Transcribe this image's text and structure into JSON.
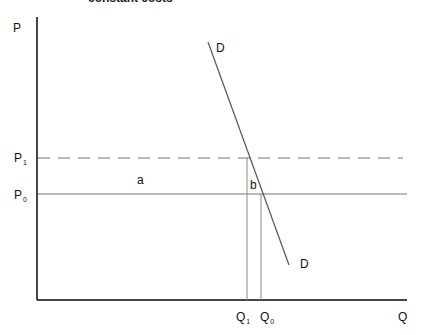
{
  "title": "constant costs",
  "axes": {
    "y_label": "P",
    "x_label": "Q"
  },
  "price_levels": [
    {
      "label": "P",
      "sub": "1",
      "style": "dashed"
    },
    {
      "label": "P",
      "sub": "0",
      "style": "solid"
    }
  ],
  "quantity_levels": [
    {
      "label": "Q",
      "sub": "1"
    },
    {
      "label": "Q",
      "sub": "0"
    }
  ],
  "demand_curve": {
    "label_top": "D",
    "label_bottom": "D"
  },
  "areas": {
    "a": "a",
    "b": "b"
  },
  "colors": {
    "axis": "#444444",
    "line": "#666666",
    "dashed": "#777777"
  }
}
